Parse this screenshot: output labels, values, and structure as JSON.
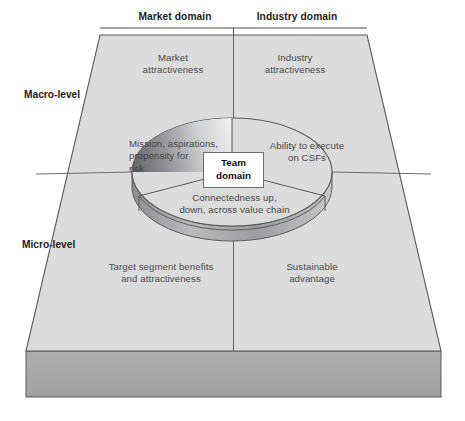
{
  "diagram": {
    "title_bar": {
      "market_domain": "Market domain",
      "industry_domain": "Industry domain"
    },
    "side_labels": {
      "macro": "Macro-level",
      "micro": "Micro-level"
    },
    "quadrants": [
      {
        "id": "market-attractiveness",
        "label": "Market\nattractiveness",
        "position": "top-left"
      },
      {
        "id": "industry-attractiveness",
        "label": "Industry\nattractiveness",
        "position": "top-right"
      },
      {
        "id": "target-segment-benefits",
        "label": "Target segment benefits\nand attractiveness",
        "position": "bottom-left"
      },
      {
        "id": "sustainable-advantage",
        "label": "Sustainable\nadvantage",
        "position": "bottom-right"
      }
    ],
    "center": {
      "label": "Team\ndomain"
    },
    "disc_segments": [
      {
        "id": "mission-aspirations",
        "label": "Mission, aspirations,\npropensity for\nrisk",
        "position": "left"
      },
      {
        "id": "ability-to-execute",
        "label": "Ability to execute\non CSFs",
        "position": "right"
      },
      {
        "id": "connectedness",
        "label": "Connectedness up,\ndown, across value chain",
        "position": "bottom"
      }
    ],
    "colors": {
      "plane_fill": "#dcdcdc",
      "slab_fill": "#a8a8a8",
      "outline": "#5b5b5b",
      "divider": "#6e6e6e",
      "disc_dark": "#6e7074",
      "disc_light": "#f2f2f2",
      "text_primary": "#1d1d1d",
      "text_secondary": "#4a4a4a",
      "box_bg": "#ffffff"
    }
  }
}
